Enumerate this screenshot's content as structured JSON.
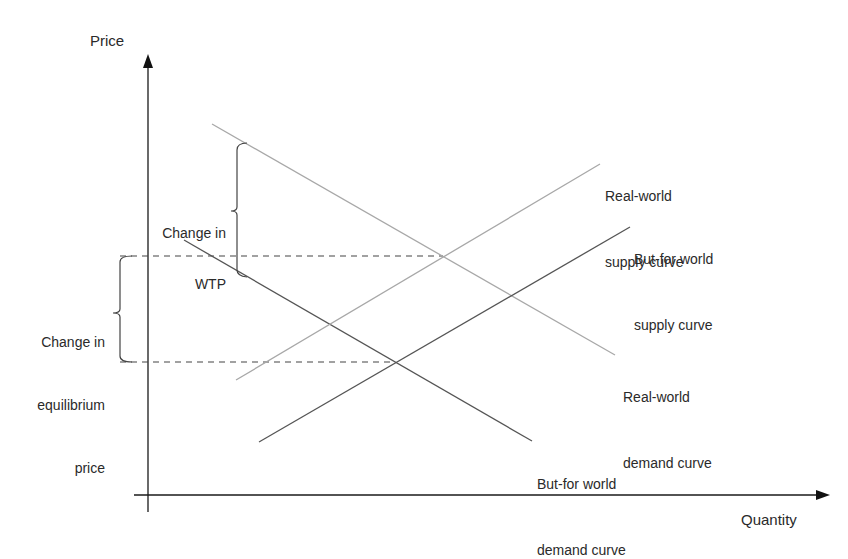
{
  "diagram": {
    "type": "supply-demand",
    "axes": {
      "y_label": "Price",
      "x_label": "Quantity",
      "origin": [
        148,
        495
      ],
      "y_axis_top": [
        148,
        60
      ],
      "x_axis_right": [
        829,
        495
      ],
      "color": "#1a1a1a"
    },
    "curves": [
      {
        "id": "real-world-demand",
        "label_line1": "Real-world",
        "label_line2": "demand curve",
        "from": [
          212,
          124
        ],
        "to": [
          615,
          355
        ],
        "color": "#a8a8a8"
      },
      {
        "id": "but-for-demand",
        "label_line1": "But-for world",
        "label_line2": "demand curve",
        "from": [
          184,
          240
        ],
        "to": [
          532,
          441
        ],
        "color": "#555555"
      },
      {
        "id": "real-world-supply",
        "label_line1": "Real-world",
        "label_line2": "supply curve",
        "from": [
          236,
          380
        ],
        "to": [
          600,
          164
        ],
        "color": "#a8a8a8"
      },
      {
        "id": "but-for-supply",
        "label_line1": "But-for world",
        "label_line2": "supply curve",
        "from": [
          259,
          442
        ],
        "to": [
          630,
          227
        ],
        "color": "#555555"
      }
    ],
    "dashed_lines": [
      {
        "id": "real-world-equilibrium-price",
        "from": [
          120,
          256
        ],
        "to": [
          443,
          256
        ]
      },
      {
        "id": "but-for-equilibrium-price",
        "from": [
          120,
          362
        ],
        "to": [
          395,
          362
        ]
      }
    ],
    "brackets": [
      {
        "id": "change-in-wtp",
        "line1": "Change in",
        "line2": "WTP",
        "x": 237,
        "top": 144,
        "bottom": 276,
        "tip_y": 211
      },
      {
        "id": "change-in-equilibrium-price",
        "line1": "Change in",
        "line2": "equilibrium",
        "line3": "price",
        "x": 120,
        "top": 256,
        "bottom": 362,
        "tip_y": 313
      }
    ]
  }
}
